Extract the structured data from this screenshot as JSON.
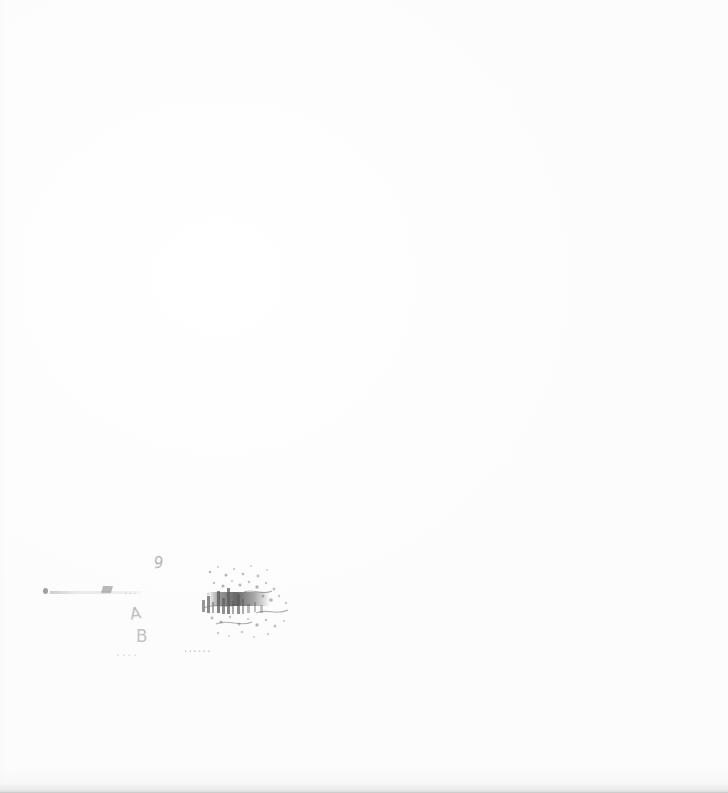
{
  "document": {
    "kind": "scanned-page",
    "page_background_color": "#fefefe",
    "ink_color": "#6e6e6e",
    "visible_text": "",
    "note_text": ""
  },
  "annotation": {
    "legibility": "illegible",
    "glyph_upper": "9",
    "glyph_mid": "...",
    "glyph_a": "A",
    "glyph_b": "B",
    "glyph_bottom_left": "....",
    "glyph_bottom_right": "......",
    "stamp_label": "",
    "smear_label": ""
  },
  "artifacts": {
    "left_margin_strip": "",
    "bottom_edge_shadow": "",
    "paper_tone": ""
  }
}
